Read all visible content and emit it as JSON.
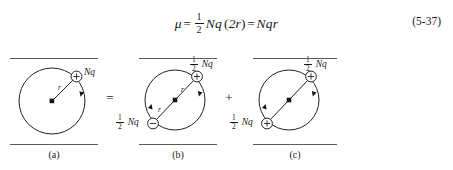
{
  "equation": {
    "lhs_symbol": "μ",
    "equals_1": "=",
    "frac_num": "1",
    "frac_den": "2",
    "term_Nq": "Nq",
    "paren_open": "(",
    "term_2r": "2r",
    "paren_close": ")",
    "equals_2": "=",
    "rhs": "Nqr",
    "number": "(5-37)",
    "full_text": "μ = 1/2 Nq(2r) = Nqr"
  },
  "figure": {
    "operators": {
      "equals": "=",
      "plus": "+"
    },
    "panels": [
      {
        "id": "a",
        "caption": "(a)",
        "charges": [
          {
            "sign": "+",
            "label_frac": false,
            "label_text": "Nq",
            "position": "upper-right"
          }
        ],
        "radius_labels": [
          "r"
        ]
      },
      {
        "id": "b",
        "caption": "(b)",
        "charges": [
          {
            "sign": "+",
            "label_frac": true,
            "label_num": "1",
            "label_den": "2",
            "label_text": "Nq",
            "position": "upper-right"
          },
          {
            "sign": "−",
            "label_frac": true,
            "label_num": "1",
            "label_den": "2",
            "label_text": "Nq",
            "position": "lower-left"
          }
        ],
        "radius_labels": [
          "r",
          "r"
        ]
      },
      {
        "id": "c",
        "caption": "(c)",
        "charges": [
          {
            "sign": "+",
            "label_frac": true,
            "label_num": "1",
            "label_den": "2",
            "label_text": "Nq",
            "position": "upper-right"
          },
          {
            "sign": "+",
            "label_frac": true,
            "label_num": "1",
            "label_den": "2",
            "label_text": "Nq",
            "position": "lower-left"
          }
        ],
        "radius_labels": []
      }
    ]
  },
  "colors": {
    "ink": "#1a1a1a",
    "rule": "#5a5a5a",
    "stroke": "#222222"
  }
}
